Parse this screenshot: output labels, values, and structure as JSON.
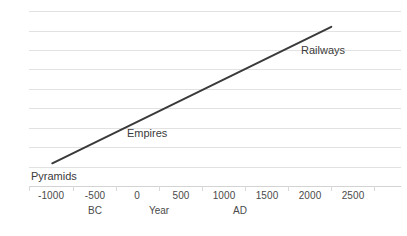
{
  "chart_data": {
    "type": "line",
    "title": "",
    "subtitle": "",
    "xlabel": "Year",
    "ylabel": "Complexity",
    "xlim": [
      -1250,
      2750
    ],
    "ylim": [
      0,
      10
    ],
    "grid": true,
    "gridlines_y": [
      1,
      2,
      3,
      4,
      5,
      6,
      7,
      8,
      9,
      10
    ],
    "legend": "none",
    "xticks": [
      {
        "value": -1000,
        "label": "-1000"
      },
      {
        "value": -500,
        "label": "-500"
      },
      {
        "value": 0,
        "label": "0"
      },
      {
        "value": 500,
        "label": "500"
      },
      {
        "value": 1000,
        "label": "1000"
      },
      {
        "value": 1500,
        "label": "1500"
      },
      {
        "value": 2000,
        "label": "2000"
      },
      {
        "value": 2500,
        "label": "2500"
      }
    ],
    "yticks": [],
    "era_labels": [
      {
        "label": "BC",
        "value": -500
      },
      {
        "label": "Year",
        "value": 250
      },
      {
        "label": "AD",
        "value": 1000
      }
    ],
    "series": [
      {
        "name": "Complexity",
        "color": "#3a3a3a",
        "points": [
          {
            "x": -1000,
            "y": 1.3
          },
          {
            "x": 2000,
            "y": 9.1
          }
        ]
      }
    ],
    "annotations": [
      {
        "text": "Pyramids",
        "x": -1100,
        "y": 0.6
      },
      {
        "text": "Empires",
        "x": 100,
        "y": 3.2
      },
      {
        "text": "Railways",
        "x": 1750,
        "y": 7.8
      }
    ]
  },
  "axis": {
    "y_label": "Complexity",
    "x_label": "Year"
  },
  "labels": {
    "pyramids": "Pyramids",
    "empires": "Empires",
    "railways": "Railways"
  },
  "colors": {
    "line": "#3a3a3a",
    "gridline": "#e2e2e2",
    "axis": "#d3d3d3",
    "text": "#4a4a4a",
    "background": "#ffffff"
  }
}
